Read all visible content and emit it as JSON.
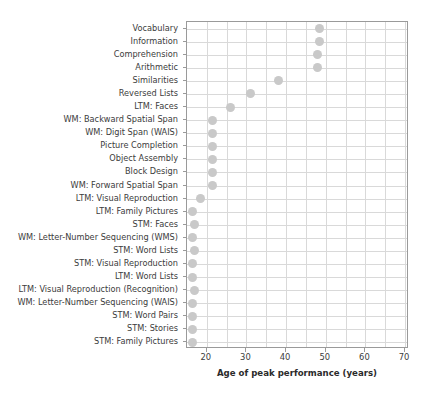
{
  "chart_data": {
    "type": "scatter",
    "title": "",
    "xlabel": "Age of peak performance (years)",
    "ylabel": "",
    "xlim": [
      15,
      71
    ],
    "ylim": [
      0,
      25
    ],
    "grid": true,
    "legend": null,
    "xticks": [
      20,
      30,
      40,
      50,
      60,
      70
    ],
    "xtick_labels": [
      "20",
      "30",
      "40",
      "50",
      "60",
      "70"
    ],
    "xminor_step": 5,
    "categories": [
      "Vocabulary",
      "Information",
      "Comprehension",
      "Arithmetic",
      "Similarities",
      "Reversed Lists",
      "LTM: Faces",
      "WM: Backward Spatial Span",
      "WM: Digit Span (WAIS)",
      "Picture Completion",
      "Object Assembly",
      "Block Design",
      "WM: Forward Spatial Span",
      "LTM: Visual Reproduction",
      "LTM: Family Pictures",
      "STM: Faces",
      "WM: Letter-Number Sequencing (WMS)",
      "STM: Word Lists",
      "STM: Visual Reproduction",
      "LTM: Word Lists",
      "LTM: Visual Reproduction (Recognition)",
      "WM: Letter-Number Sequencing (WAIS)",
      "STM: Word Pairs",
      "STM: Stories",
      "STM: Family Pictures"
    ],
    "values": [
      48.5,
      48.5,
      48.0,
      48.0,
      38.0,
      31.0,
      26.0,
      21.5,
      21.5,
      21.5,
      21.5,
      21.5,
      21.5,
      18.5,
      16.5,
      17.0,
      16.5,
      17.0,
      16.5,
      16.5,
      17.0,
      16.5,
      16.5,
      16.5,
      16.5
    ],
    "marker": {
      "shape": "circle",
      "color": "#c9c9c9",
      "size": 9
    },
    "axis_color": "#9a9a9a",
    "grid_color": "#d9d9d9",
    "text_color": "#3c3c3c"
  }
}
